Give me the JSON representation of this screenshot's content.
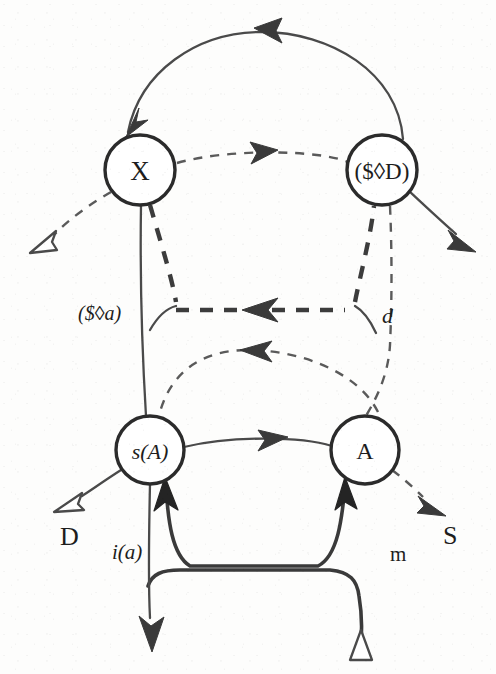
{
  "diagram": {
    "kind": "graph-diagram",
    "title": "",
    "background_color": "#fdfdfc",
    "ink_color": "#2b2b2b",
    "nodes": [
      {
        "id": "X",
        "label": "X",
        "label_style": "upright",
        "cx": 140,
        "cy": 170,
        "r": 35,
        "font_size": 27
      },
      {
        "id": "SD",
        "label": "($◊D)",
        "label_style": "upright",
        "cx": 382,
        "cy": 170,
        "r": 35,
        "font_size": 23
      },
      {
        "id": "sA",
        "label": "s(A)",
        "label_style": "mixed-italic",
        "cx": 150,
        "cy": 450,
        "r": 34,
        "font_size": 22
      },
      {
        "id": "A",
        "label": "A",
        "label_style": "upright",
        "cx": 365,
        "cy": 450,
        "r": 34,
        "font_size": 24
      }
    ],
    "edge_labels": [
      {
        "id": "lbl-sda",
        "text": "($◊a)",
        "x": 78,
        "y": 313,
        "font_size": 20,
        "style": "mixed-italic"
      },
      {
        "id": "lbl-d",
        "text": "d",
        "x": 382,
        "y": 315,
        "font_size": 22,
        "style": "italic"
      },
      {
        "id": "lbl-D",
        "text": "D",
        "x": 60,
        "y": 536,
        "font_size": 26,
        "style": "upright"
      },
      {
        "id": "lbl-ia",
        "text": "i(a)",
        "x": 112,
        "y": 552,
        "font_size": 21,
        "style": "italic"
      },
      {
        "id": "lbl-m",
        "text": "m",
        "x": 390,
        "y": 554,
        "font_size": 21,
        "style": "upright"
      },
      {
        "id": "lbl-S",
        "text": "S",
        "x": 443,
        "y": 535,
        "font_size": 26,
        "style": "upright"
      }
    ],
    "edges": [
      {
        "id": "arc-top",
        "from": "SD",
        "to": "X",
        "line": "solid",
        "arrowheads": 2,
        "note": "long arc over the top, arrowhead at apex and at X"
      },
      {
        "id": "x-to-sd",
        "from": "X",
        "to": "SD",
        "line": "dashed-thin",
        "arrowheads": 1,
        "note": "horizontal dashed arrow, arrowhead near middle"
      },
      {
        "id": "x-out-left",
        "from": "X",
        "to": null,
        "line": "dashed-thin",
        "arrowheads": 1,
        "head": "hollow",
        "note": "dashed line down-left from X ending in open triangle"
      },
      {
        "id": "sd-out-right",
        "from": "SD",
        "to": null,
        "line": "solid",
        "arrowheads": 1,
        "head": "filled",
        "note": "solid line down-right from ($◊D)"
      },
      {
        "id": "x-down",
        "from": "X",
        "to": "sA",
        "line": "solid",
        "arrowheads": 0,
        "note": "long vertical solid line from X through to s(A)"
      },
      {
        "id": "bracket-upper",
        "from": "SD",
        "to": "X",
        "line": "dashed-thick",
        "arrowheads": 1,
        "note": "thick dashed bracket: down from X, left-pointing horizontal, up to ($◊D)"
      },
      {
        "id": "sd-down",
        "from": "SD",
        "to": "A",
        "line": "dashed-thin",
        "arrowheads": 0,
        "note": "thin dashed vertical line from ($◊D) down to A"
      },
      {
        "id": "arc-a-to-sa",
        "from": "A",
        "to": "sA",
        "line": "dashed-thin",
        "arrowheads": 1,
        "note": "dashed arc above the lower nodes, arrowhead pointing left"
      },
      {
        "id": "sa-to-a",
        "from": "sA",
        "to": "A",
        "line": "solid",
        "arrowheads": 1,
        "note": "solid horizontal arrow pointing right"
      },
      {
        "id": "sa-out-left",
        "from": "sA",
        "to": null,
        "line": "solid",
        "arrowheads": 1,
        "head": "hollow",
        "note": "solid line down-left from s(A) ending in open triangle, above D"
      },
      {
        "id": "a-out-right",
        "from": "A",
        "to": null,
        "line": "dashed-thin",
        "arrowheads": 1,
        "head": "filled",
        "note": "dashed line down-right from A, above S"
      },
      {
        "id": "loop-inner",
        "from": "A",
        "to": "sA",
        "line": "solid-thick",
        "arrowheads": 2,
        "note": "inner rounded bracket below, thick arrowheads up into s(A) and A"
      },
      {
        "id": "loop-outer",
        "from": null,
        "to": null,
        "line": "solid-thick",
        "arrowheads": 1,
        "head": "hollow",
        "note": "outer rounded bracket below ending in open triangle at lower right"
      },
      {
        "id": "sa-down",
        "from": "sA",
        "to": null,
        "line": "solid",
        "arrowheads": 1,
        "head": "filled",
        "note": "vertical line down from s(A) to bottom with filled arrowhead"
      }
    ]
  }
}
